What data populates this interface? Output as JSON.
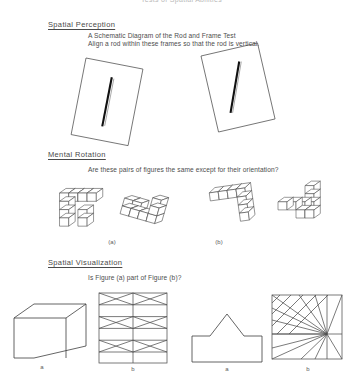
{
  "document": {
    "title": "Tests of Spatial Abilities"
  },
  "sections": [
    {
      "id": "spatial-perception",
      "heading": "Spatial Perception",
      "lines": [
        "A Schematic Diagram of the Rod and Frame Test",
        "Align a rod within these frames so that the rod is vertical."
      ],
      "figures": [
        {
          "id": "rod-frame-left",
          "frame_tilt_deg": 11,
          "rod_tilt_deg": 0
        },
        {
          "id": "rod-frame-right",
          "frame_tilt_deg": -13,
          "rod_tilt_deg": -17
        }
      ]
    },
    {
      "id": "mental-rotation",
      "heading": "Mental Rotation",
      "lines": [
        "Are these pairs of figures the same except for their orientation?"
      ],
      "pairs": [
        {
          "label": "(a)"
        },
        {
          "label": "(b)"
        }
      ]
    },
    {
      "id": "spatial-visualization",
      "heading": "Spatial Visualization",
      "lines": [
        "Is Figure (a) part of Figure (b)?"
      ],
      "figures": [
        {
          "id": "box-solid",
          "label": "a"
        },
        {
          "id": "truss-grid",
          "label": "b"
        },
        {
          "id": "house-polygon",
          "label": "a"
        },
        {
          "id": "diagonal-square",
          "label": "b"
        }
      ]
    }
  ],
  "colors": {
    "ink": "#4a4a4a",
    "rod": "#111111",
    "paper": "#ffffff",
    "faint": "#b9b9b9"
  }
}
